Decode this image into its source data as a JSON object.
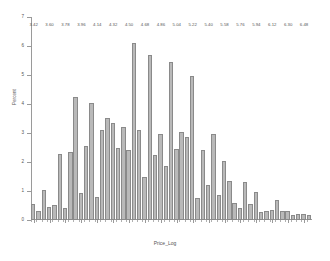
{
  "chart_data": {
    "type": "bar",
    "title": "",
    "subtitle": "",
    "xlabel": "Price_Log",
    "ylabel": "Percent",
    "grid": false,
    "legend": "none",
    "ylim": [
      0,
      7
    ],
    "xlim": [
      3.39,
      6.57
    ],
    "bin_width": 0.06,
    "y_ticks": [
      "0",
      "1",
      "2",
      "3",
      "4",
      "5",
      "6",
      "7"
    ],
    "y_tick_values": [
      0,
      1,
      2,
      3,
      4,
      5,
      6,
      7
    ],
    "x_ticks": [
      "3.42",
      "3.60",
      "3.78",
      "3.96",
      "4.14",
      "4.32",
      "4.50",
      "4.68",
      "4.86",
      "5.04",
      "5.22",
      "5.40",
      "5.58",
      "5.76",
      "5.94",
      "6.12",
      "6.30",
      "6.48"
    ],
    "x_tick_values": [
      3.42,
      3.6,
      3.78,
      3.96,
      4.14,
      4.32,
      4.5,
      4.68,
      4.86,
      5.04,
      5.22,
      5.4,
      5.58,
      5.76,
      5.94,
      6.12,
      6.3,
      6.48
    ],
    "categories": [
      3.42,
      3.48,
      3.54,
      3.6,
      3.66,
      3.72,
      3.78,
      3.84,
      3.9,
      3.96,
      4.02,
      4.08,
      4.14,
      4.2,
      4.26,
      4.32,
      4.38,
      4.44,
      4.5,
      4.56,
      4.62,
      4.68,
      4.74,
      4.8,
      4.86,
      4.92,
      4.98,
      5.04,
      5.1,
      5.16,
      5.22,
      5.28,
      5.34,
      5.4,
      5.46,
      5.52,
      5.58,
      5.64,
      5.7,
      5.76,
      5.82,
      5.88,
      5.94,
      6.0,
      6.06,
      6.12,
      6.18,
      6.24,
      6.3,
      6.36,
      6.42,
      6.48,
      6.54
    ],
    "values": [
      0.55,
      0.3,
      1.05,
      0.45,
      0.52,
      2.28,
      0.42,
      2.35,
      4.25,
      0.92,
      2.55,
      4.05,
      0.8,
      3.1,
      3.52,
      3.35,
      2.5,
      3.2,
      2.4,
      6.1,
      3.1,
      1.5,
      5.7,
      2.25,
      2.95,
      1.85,
      5.45,
      2.45,
      3.05,
      2.85,
      4.95,
      0.75,
      2.4,
      1.2,
      2.95,
      0.85,
      2.05,
      1.35,
      0.6,
      0.4,
      1.3,
      0.55,
      0.95,
      0.28,
      0.32,
      0.35,
      0.7,
      0.3,
      0.32,
      0.18,
      0.22,
      0.2,
      0.18
    ],
    "bar_color": "#b9b9b9",
    "bar_border_color": "#8a8a8a",
    "axis_color": "#9a9a9a",
    "background_color": "#ffffff",
    "text_color": "#555555"
  }
}
